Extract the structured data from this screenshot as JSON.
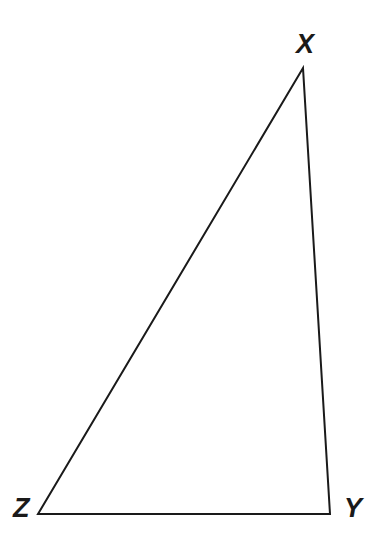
{
  "figure": {
    "kind": "geometry-diagram",
    "shape": "triangle",
    "background_color": "#ffffff",
    "stroke_color": "#1a1a1a",
    "stroke_width": 2,
    "canvas": {
      "width": 383,
      "height": 557
    },
    "vertices": [
      {
        "id": "X",
        "label": "X",
        "x": 303,
        "y": 68
      },
      {
        "id": "Y",
        "label": "Y",
        "x": 330,
        "y": 514
      },
      {
        "id": "Z",
        "label": "Z",
        "x": 38,
        "y": 514
      }
    ],
    "edges": [
      {
        "id": "XY",
        "from": "X",
        "to": "Y"
      },
      {
        "id": "YZ",
        "from": "Y",
        "to": "Z"
      },
      {
        "id": "ZX",
        "from": "Z",
        "to": "X"
      }
    ],
    "label_positions": {
      "X": {
        "x": 296,
        "y": 31
      },
      "Y": {
        "x": 344,
        "y": 495
      },
      "Z": {
        "x": 13,
        "y": 495
      }
    }
  },
  "chart_data": {
    "type": "scatter",
    "title": "",
    "xlabel": "",
    "ylabel": "",
    "points": [
      {
        "name": "X",
        "x": 303,
        "y": 68
      },
      {
        "name": "Y",
        "x": 330,
        "y": 514
      },
      {
        "name": "Z",
        "x": 38,
        "y": 514
      }
    ],
    "annotations": [
      "X",
      "Y",
      "Z"
    ]
  }
}
